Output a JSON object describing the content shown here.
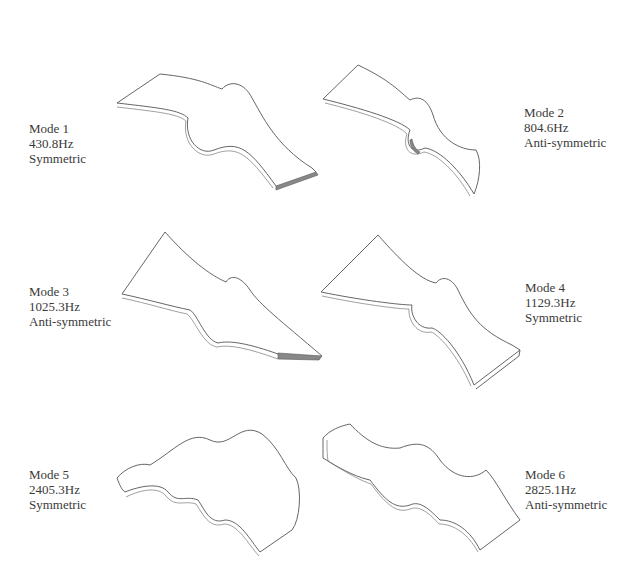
{
  "figure": {
    "modes": [
      {
        "mode": "Mode 1",
        "frequency": "430.8Hz",
        "type": "Symmetric"
      },
      {
        "mode": "Mode 2",
        "frequency": "804.6Hz",
        "type": "Anti-symmetric"
      },
      {
        "mode": "Mode 3",
        "frequency": "1025.3Hz",
        "type": "Anti-symmetric"
      },
      {
        "mode": "Mode 4",
        "frequency": "1129.3Hz",
        "type": "Symmetric"
      },
      {
        "mode": "Mode 5",
        "frequency": "2405.3Hz",
        "type": "Symmetric"
      },
      {
        "mode": "Mode 6",
        "frequency": "2825.1Hz",
        "type": "Anti-symmetric"
      }
    ]
  }
}
